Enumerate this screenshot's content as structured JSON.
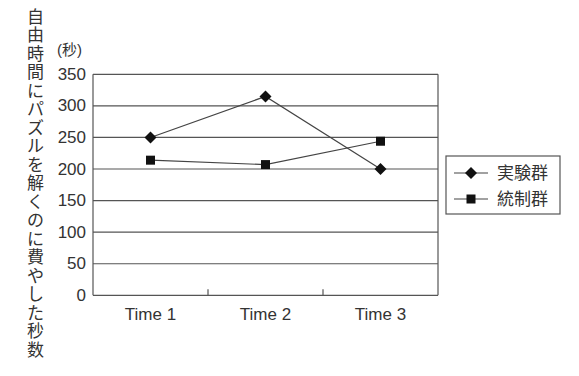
{
  "chart_data": {
    "type": "line",
    "title": "",
    "xlabel": "",
    "ylabel": "自由時間にパズルを解くのに費やした秒数",
    "yunit": "(秒)",
    "categories": [
      "Time 1",
      "Time 2",
      "Time 3"
    ],
    "series": [
      {
        "name": "実験群",
        "marker": "diamond",
        "values": [
          250,
          315,
          200
        ]
      },
      {
        "name": "統制群",
        "marker": "square",
        "values": [
          214,
          207,
          244
        ]
      }
    ],
    "ylim": [
      0,
      350
    ],
    "yticks": [
      0,
      50,
      100,
      150,
      200,
      250,
      300,
      350
    ],
    "grid": true,
    "legend_position": "right"
  },
  "colors": {
    "background": "#ffffff",
    "text": "#333333",
    "axis": "#555555",
    "grid": "#555555",
    "series_line": "#444444",
    "marker": "#111111"
  }
}
